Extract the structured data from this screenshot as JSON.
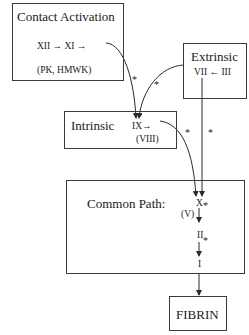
{
  "diagram": {
    "boxes": {
      "contact": {
        "title": "Contact Activation",
        "sequence": "XII → XI →",
        "cofactors": "(PK, HMWK)"
      },
      "extrinsic": {
        "title": "Extrinsic",
        "sequence": "VII ← III"
      },
      "intrinsic": {
        "title": "Intrinsic",
        "factor": "IX→",
        "cofactor": "(VIII)"
      },
      "common": {
        "title": "Common Path:",
        "factor_x": "X",
        "cofactor_v": "(V)",
        "factor_ii": "II",
        "factor_i": "I"
      },
      "fibrin": {
        "label": "FIBRIN"
      }
    },
    "markers": {
      "star": "*"
    },
    "edges": [
      {
        "from": "XI",
        "to": "IX",
        "marked": true
      },
      {
        "from": "VII",
        "to": "IX",
        "marked": true
      },
      {
        "from": "IX",
        "to": "X",
        "marked": true
      },
      {
        "from": "VII",
        "to": "X",
        "marked": true
      },
      {
        "from": "X",
        "to": "II",
        "marked": true
      },
      {
        "from": "II",
        "to": "I",
        "marked": true
      },
      {
        "from": "I",
        "to": "FIBRIN",
        "marked": false
      }
    ],
    "colors": {
      "line": "#2a2a2a",
      "background": "#ffffff"
    }
  }
}
